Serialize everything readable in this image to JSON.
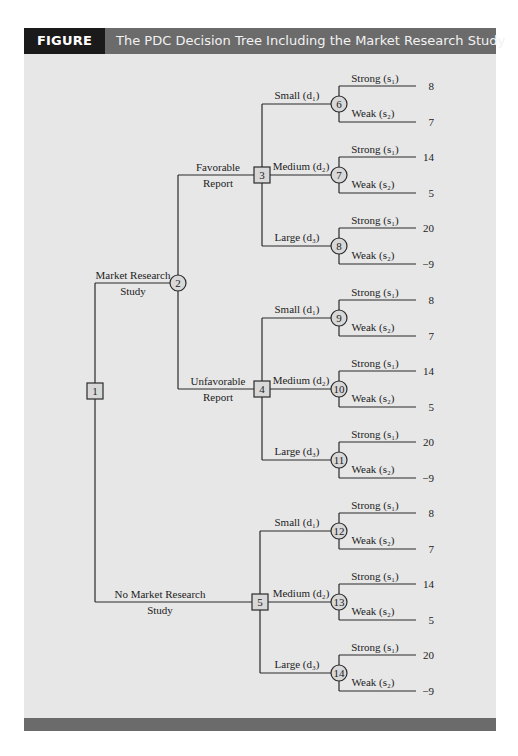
{
  "figure": {
    "label": "FIGURE 15.5",
    "title": "The PDC Decision Tree Including the Market Research Study",
    "colors": {
      "label_bg": "#1a1a1a",
      "title_bg": "#6b6b6b",
      "panel_bg": "#e7e7e7"
    }
  },
  "tree": {
    "root": {
      "id": "1",
      "type": "decision"
    },
    "root_branches": [
      {
        "label_line1": "Market Research",
        "label_line2": "Study",
        "to": "2"
      },
      {
        "label_line1": "No Market Research",
        "label_line2": "Study",
        "to": "5"
      }
    ],
    "report_node": {
      "id": "2",
      "type": "chance"
    },
    "report_branches": [
      {
        "label_line1": "Favorable",
        "label_line2": "Report",
        "to": "3"
      },
      {
        "label_line1": "Unfavorable",
        "label_line2": "Report",
        "to": "4"
      }
    ],
    "decision_nodes": [
      {
        "id": "3",
        "options": [
          {
            "label": "Small (d₁)",
            "chance_node": "6",
            "strong": "Strong (s₁)",
            "weak": "Weak (s₂)",
            "payoff_strong": "8",
            "payoff_weak": "7"
          },
          {
            "label": "Medium (d₂)",
            "chance_node": "7",
            "strong": "Strong (s₁)",
            "weak": "Weak (s₂)",
            "payoff_strong": "14",
            "payoff_weak": "5"
          },
          {
            "label": "Large (d₃)",
            "chance_node": "8",
            "strong": "Strong (s₁)",
            "weak": "Weak (s₂)",
            "payoff_strong": "20",
            "payoff_weak": "−9"
          }
        ]
      },
      {
        "id": "4",
        "options": [
          {
            "label": "Small (d₁)",
            "chance_node": "9",
            "strong": "Strong (s₁)",
            "weak": "Weak (s₂)",
            "payoff_strong": "8",
            "payoff_weak": "7"
          },
          {
            "label": "Medium (d₂)",
            "chance_node": "10",
            "strong": "Strong (s₁)",
            "weak": "Weak (s₂)",
            "payoff_strong": "14",
            "payoff_weak": "5"
          },
          {
            "label": "Large (d₃)",
            "chance_node": "11",
            "strong": "Strong (s₁)",
            "weak": "Weak (s₂)",
            "payoff_strong": "20",
            "payoff_weak": "−9"
          }
        ]
      },
      {
        "id": "5",
        "options": [
          {
            "label": "Small (d₁)",
            "chance_node": "12",
            "strong": "Strong (s₁)",
            "weak": "Weak (s₂)",
            "payoff_strong": "8",
            "payoff_weak": "7"
          },
          {
            "label": "Medium (d₂)",
            "chance_node": "13",
            "strong": "Strong (s₁)",
            "weak": "Weak (s₂)",
            "payoff_strong": "14",
            "payoff_weak": "5"
          },
          {
            "label": "Large (d₃)",
            "chance_node": "14",
            "strong": "Strong (s₁)",
            "weak": "Weak (s₂)",
            "payoff_strong": "20",
            "payoff_weak": "−9"
          }
        ]
      }
    ]
  }
}
